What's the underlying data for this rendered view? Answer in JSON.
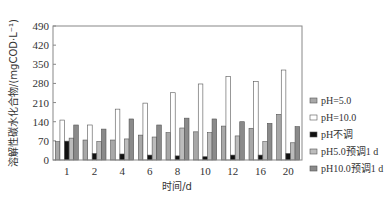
{
  "chart_data": {
    "type": "bar",
    "title": "",
    "xlabel": "时间/d",
    "ylabel": "溶解性碳水化合物/(mgCOD·L⁻¹)",
    "ylim": [
      0,
      490
    ],
    "yticks": [
      0,
      70,
      140,
      210,
      280,
      350,
      420,
      490
    ],
    "categories": [
      "1",
      "2",
      "4",
      "6",
      "8",
      "10",
      "12",
      "16",
      "20"
    ],
    "series": [
      {
        "name": "pH=5.0",
        "color": "#a8a8a8",
        "values": [
          67,
          73,
          73,
          91,
          100,
          103,
          124,
          116,
          167
        ]
      },
      {
        "name": "pH=10.0",
        "color": "#ffffff",
        "values": [
          146,
          128,
          186,
          208,
          246,
          278,
          305,
          287,
          329
        ]
      },
      {
        "name": "pH不调",
        "color": "#111111",
        "values": [
          69,
          24,
          22,
          18,
          15,
          12,
          18,
          18,
          24
        ]
      },
      {
        "name": "pH5.0预调1 d",
        "color": "#bcbcbc",
        "values": [
          80,
          67,
          77,
          84,
          117,
          100,
          88,
          67,
          63
        ]
      },
      {
        "name": "pH10.0预调1 d",
        "color": "#8a8a8a",
        "values": [
          128,
          113,
          150,
          128,
          153,
          150,
          140,
          134,
          122
        ]
      }
    ],
    "legend_position": "right",
    "grid": false
  }
}
